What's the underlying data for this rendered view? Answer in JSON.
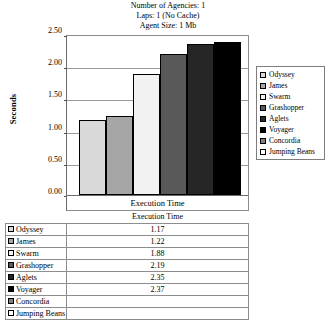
{
  "title": {
    "line1": "Number of Agencies: 1",
    "line2": "Laps: 1 (No Cache)",
    "line3": "Agent Size: 1 Mb"
  },
  "axes": {
    "y_title": "Seconds",
    "category_label": "Execution Time",
    "y_ticks": [
      "2.50",
      "2.00",
      "1.50",
      "1.00",
      "0.50",
      "0.00"
    ]
  },
  "legend": {
    "items": [
      {
        "label": "Odyssey",
        "color": "#d9d9d9"
      },
      {
        "label": "James",
        "color": "#a6a6a6"
      },
      {
        "label": "Swarm",
        "color": "#f2f2f2"
      },
      {
        "label": "Grashopper",
        "color": "#595959"
      },
      {
        "label": "Aglets",
        "color": "#262626"
      },
      {
        "label": "Voyager",
        "color": "#000000"
      },
      {
        "label": "Concordia",
        "color": "#808080"
      },
      {
        "label": "Jumping Beans",
        "color": "#ffffff"
      }
    ]
  },
  "table": {
    "header": "Execution Time",
    "rows": [
      {
        "name": "Odyssey",
        "value": "1.17",
        "color": "#d9d9d9"
      },
      {
        "name": "James",
        "value": "1.22",
        "color": "#a6a6a6"
      },
      {
        "name": "Swarm",
        "value": "1.88",
        "color": "#f2f2f2"
      },
      {
        "name": "Grashopper",
        "value": "2.19",
        "color": "#595959"
      },
      {
        "name": "Aglets",
        "value": "2.35",
        "color": "#262626"
      },
      {
        "name": "Voyager",
        "value": "2.37",
        "color": "#000000"
      },
      {
        "name": "Concordia",
        "value": "",
        "color": "#808080"
      },
      {
        "name": "Jumping Beans",
        "value": "",
        "color": "#ffffff"
      }
    ]
  },
  "chart_data": {
    "type": "bar",
    "xlabel": "Execution Time",
    "ylabel": "Seconds",
    "ylim": [
      0,
      2.5
    ],
    "ytick_step": 0.5,
    "grid": true,
    "legend_position": "right",
    "categories": [
      "Execution Time"
    ],
    "series": [
      {
        "name": "Odyssey",
        "values": [
          1.17
        ],
        "color": "#d9d9d9"
      },
      {
        "name": "James",
        "values": [
          1.22
        ],
        "color": "#a6a6a6"
      },
      {
        "name": "Swarm",
        "values": [
          1.88
        ],
        "color": "#f2f2f2"
      },
      {
        "name": "Grashopper",
        "values": [
          2.19
        ],
        "color": "#595959"
      },
      {
        "name": "Aglets",
        "values": [
          2.35
        ],
        "color": "#262626"
      },
      {
        "name": "Voyager",
        "values": [
          2.37
        ],
        "color": "#000000"
      },
      {
        "name": "Concordia",
        "values": [
          null
        ],
        "color": "#808080"
      },
      {
        "name": "Jumping Beans",
        "values": [
          null
        ],
        "color": "#ffffff"
      }
    ]
  }
}
